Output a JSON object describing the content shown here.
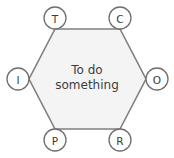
{
  "diagram": {
    "type": "hexagon-node-diagram",
    "center_label": {
      "line1": "To do",
      "line2": "something"
    },
    "colors": {
      "hexagon_fill": "#f4f4f4",
      "hexagon_stroke": "#808080",
      "node_fill": "#ffffff",
      "node_stroke": "#6e6e6e",
      "text": "#3d3d3d",
      "background": "#ffffff"
    },
    "nodes": [
      {
        "id": "T",
        "label": "T",
        "position": "top-left",
        "cx": 55,
        "cy": 18,
        "r": 11
      },
      {
        "id": "C",
        "label": "C",
        "position": "top-right",
        "cx": 120,
        "cy": 18,
        "r": 11
      },
      {
        "id": "O",
        "label": "O",
        "position": "right",
        "cx": 157,
        "cy": 79,
        "r": 11
      },
      {
        "id": "R",
        "label": "R",
        "position": "bottom-right",
        "cx": 120,
        "cy": 140,
        "r": 11
      },
      {
        "id": "P",
        "label": "P",
        "position": "bottom-left",
        "cx": 55,
        "cy": 140,
        "r": 11
      },
      {
        "id": "I",
        "label": "I",
        "position": "left",
        "cx": 18,
        "cy": 79,
        "r": 11
      }
    ],
    "hexagon_points": "55,29 120,29 146,79 120,129 55,129 29,79"
  }
}
